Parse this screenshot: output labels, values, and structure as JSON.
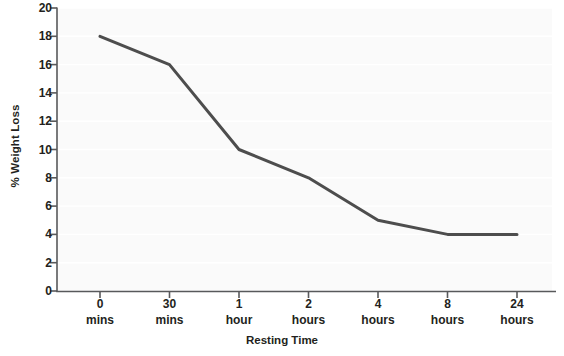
{
  "chart_data": {
    "type": "line",
    "title": "",
    "xlabel": "Resting Time",
    "ylabel": "% Weight Loss",
    "categories": [
      "0\nmins",
      "30\nmins",
      "1\nhour",
      "2\nhours",
      "4\nhours",
      "8\nhours",
      "24\nhours"
    ],
    "category_lines": [
      {
        "line1": "0",
        "line2": "mins"
      },
      {
        "line1": "30",
        "line2": "mins"
      },
      {
        "line1": "1",
        "line2": "hour"
      },
      {
        "line1": "2",
        "line2": "hours"
      },
      {
        "line1": "4",
        "line2": "hours"
      },
      {
        "line1": "8",
        "line2": "hours"
      },
      {
        "line1": "24",
        "line2": "hours"
      }
    ],
    "values": [
      18,
      16,
      10,
      8,
      5,
      4,
      4
    ],
    "ylim": [
      0,
      20
    ],
    "ytick_values": [
      0,
      2,
      4,
      6,
      8,
      10,
      12,
      14,
      16,
      18,
      20
    ],
    "ytick_labels": [
      "0",
      "2",
      "4",
      "6",
      "8",
      "10",
      "12",
      "14",
      "16",
      "18",
      "20"
    ],
    "grid": true,
    "grid_axis": "y",
    "legend": false,
    "legend_position": "none",
    "markers": false,
    "line_color": "#4d4d4d",
    "line_width": 3,
    "plot_background": "#fafafa",
    "grid_color": "#ffffff",
    "axis_color": "#58595b"
  }
}
